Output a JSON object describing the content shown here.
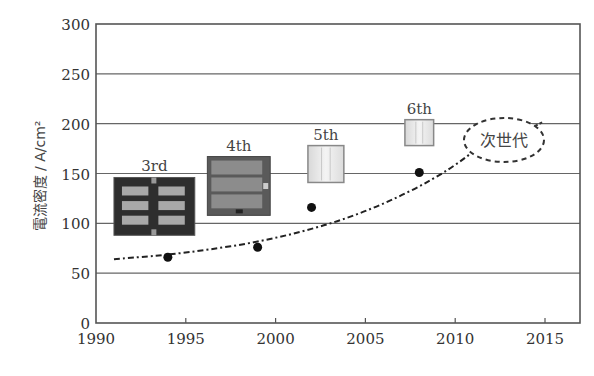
{
  "chart_data": {
    "type": "scatter",
    "title": "",
    "xlabel": "",
    "ylabel": "電流密度 / A/cm²",
    "xlim": [
      1990,
      2017
    ],
    "ylim": [
      0,
      300
    ],
    "x_ticks": [
      1990,
      1995,
      2000,
      2005,
      2010,
      2015
    ],
    "y_ticks": [
      0,
      50,
      100,
      150,
      200,
      250,
      300
    ],
    "grid": "horizontal",
    "series": [
      {
        "name": "measured",
        "marker": "filled-circle",
        "points": [
          {
            "x": 1994,
            "y": 66
          },
          {
            "x": 1999,
            "y": 76
          },
          {
            "x": 2002,
            "y": 116
          },
          {
            "x": 2008,
            "y": 151
          }
        ]
      },
      {
        "name": "trend",
        "style": "dash-dot",
        "points": [
          {
            "x": 1991,
            "y": 64
          },
          {
            "x": 1995,
            "y": 70
          },
          {
            "x": 2000,
            "y": 84
          },
          {
            "x": 2005,
            "y": 110
          },
          {
            "x": 2010,
            "y": 155
          },
          {
            "x": 2013,
            "y": 205
          }
        ]
      }
    ],
    "annotations": [
      {
        "label": "3rd",
        "x_range": [
          1991,
          1995.5
        ],
        "y_range": [
          88,
          146
        ],
        "style": "dark"
      },
      {
        "label": "4th",
        "x_range": [
          1996.2,
          1999.7
        ],
        "y_range": [
          108,
          167
        ],
        "style": "medium"
      },
      {
        "label": "5th",
        "x_range": [
          2001.8,
          2003.8
        ],
        "y_range": [
          141,
          178
        ],
        "style": "light"
      },
      {
        "label": "6th",
        "x_range": [
          2007.2,
          2008.8
        ],
        "y_range": [
          178,
          204
        ],
        "style": "light"
      },
      {
        "label": "次世代",
        "x": 2012,
        "y": 183,
        "shape": "dashed-ellipse"
      }
    ]
  },
  "colors": {
    "axis": "#555555",
    "grid": "#666666",
    "points": "#111111",
    "trend": "#222222"
  }
}
